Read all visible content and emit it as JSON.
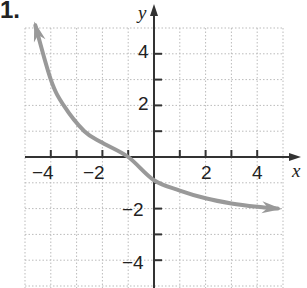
{
  "problem_number": "1.",
  "chart_data": {
    "type": "line",
    "title": "",
    "xlabel": "x",
    "ylabel": "y",
    "xlim": [
      -5,
      5
    ],
    "ylim": [
      -5,
      5
    ],
    "grid": true,
    "x_ticks": [
      -4,
      -2,
      2,
      4
    ],
    "y_ticks": [
      4,
      2,
      -2,
      -4
    ],
    "series": [
      {
        "name": "curve",
        "color": "#999999",
        "arrows": "both",
        "x": [
          -4.6,
          -4.0,
          -3.5,
          -2.7,
          -2.0,
          -1.0,
          0.0,
          1.0,
          2.0,
          3.0,
          4.0,
          4.8
        ],
        "y": [
          5.1,
          3.0,
          2.0,
          1.0,
          0.55,
          0.0,
          -0.9,
          -1.3,
          -1.6,
          -1.8,
          -1.93,
          -2.0
        ]
      }
    ]
  }
}
